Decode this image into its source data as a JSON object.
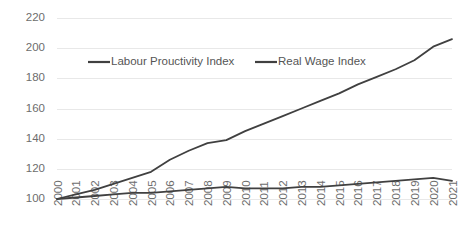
{
  "chart_data": {
    "type": "line",
    "title": "",
    "xlabel": "",
    "ylabel": "",
    "ylim": [
      100,
      220
    ],
    "yticks": [
      100,
      120,
      140,
      160,
      180,
      200,
      220
    ],
    "grid": true,
    "legend_position": "top-center",
    "x": [
      2000,
      2001,
      2002,
      2003,
      2004,
      2005,
      2006,
      2007,
      2008,
      2009,
      2010,
      2011,
      2012,
      2013,
      2014,
      2015,
      2016,
      2017,
      2018,
      2019,
      2020,
      2021
    ],
    "categories": [
      "2000",
      "2001",
      "2002",
      "2003",
      "2004",
      "2005",
      "2006",
      "2007",
      "2008",
      "2009",
      "2010",
      "2011",
      "2012",
      "2013",
      "2014",
      "2015",
      "2016",
      "2017",
      "2018",
      "2019",
      "2020",
      "2021"
    ],
    "series": [
      {
        "name": "Labour Prouctivity Index",
        "color": "#404040",
        "values": [
          100,
          103,
          106,
          110,
          114,
          118,
          126,
          132,
          137,
          139,
          145,
          150,
          155,
          160,
          165,
          170,
          176,
          181,
          186,
          192,
          201,
          206
        ]
      },
      {
        "name": "Real Wage Index",
        "color": "#404040",
        "values": [
          100,
          101,
          102,
          103,
          104,
          104,
          105,
          106,
          107,
          108,
          107,
          107,
          107,
          108,
          108,
          109,
          110,
          111,
          112,
          113,
          114,
          112
        ]
      }
    ]
  },
  "legend": {
    "items": [
      {
        "label": "Labour Prouctivity Index"
      },
      {
        "label": "Real Wage Index"
      }
    ]
  },
  "axes": {
    "y_labels": [
      "220",
      "200",
      "180",
      "160",
      "140",
      "120",
      "100"
    ],
    "x_labels": [
      "2000",
      "2001",
      "2002",
      "2003",
      "2004",
      "2005",
      "2006",
      "2007",
      "2008",
      "2009",
      "2010",
      "2011",
      "2012",
      "2013",
      "2014",
      "2015",
      "2016",
      "2017",
      "2018",
      "2019",
      "2020",
      "2021"
    ]
  },
  "colors": {
    "series_line": "#404040",
    "gridline": "#e8e8e8",
    "tick_text": "#6d6d6d",
    "legend_text": "#555555",
    "background": "#ffffff"
  }
}
